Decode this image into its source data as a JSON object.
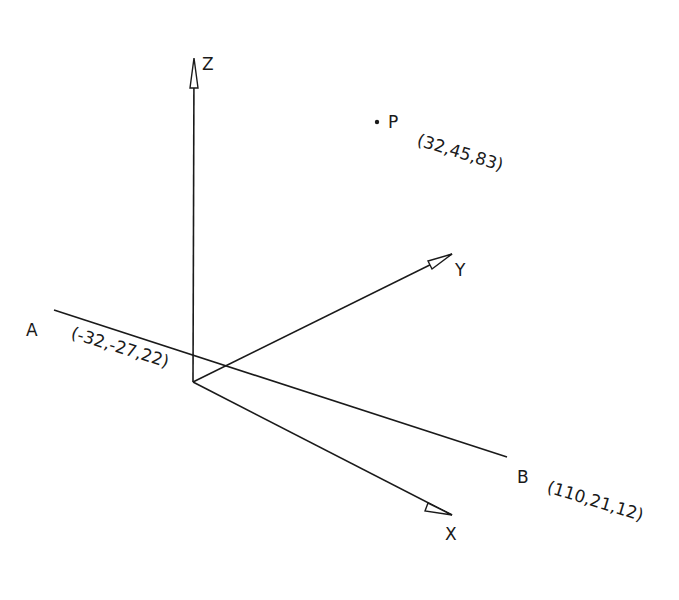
{
  "diagram": {
    "axes": {
      "x": {
        "label": "X"
      },
      "y": {
        "label": "Y"
      },
      "z": {
        "label": "Z"
      }
    },
    "line": {
      "start": {
        "label": "A",
        "coords": "(-32,-27,22)"
      },
      "end": {
        "label": "B",
        "coords": "(110,21,12)"
      }
    },
    "point": {
      "label": "P",
      "coords": "(32,45,83)"
    },
    "colors": {
      "stroke": "#1a1a1a",
      "background": "#ffffff"
    }
  }
}
